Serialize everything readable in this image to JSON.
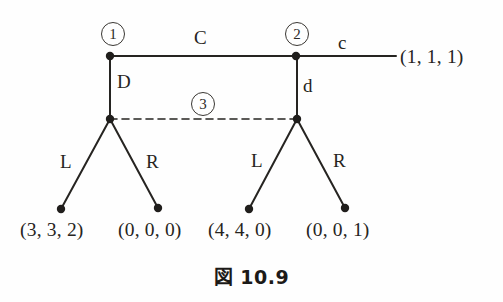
{
  "figure": {
    "caption_mark": "図",
    "caption_number": "10.9",
    "background_color": "#fefefe",
    "ink_color": "#262421"
  },
  "nodes": [
    {
      "id": "node-1",
      "label": "①",
      "plain_label": "1",
      "x": 110,
      "y": 56,
      "kind": "decision"
    },
    {
      "id": "node-2",
      "label": "②",
      "plain_label": "2",
      "x": 296,
      "y": 56,
      "kind": "decision"
    },
    {
      "id": "node-3a",
      "label": "",
      "plain_label": "",
      "x": 110,
      "y": 119,
      "kind": "decision"
    },
    {
      "id": "node-3b",
      "label": "",
      "plain_label": "",
      "x": 297,
      "y": 119,
      "kind": "decision"
    }
  ],
  "information_set": {
    "label": "③",
    "plain_label": "3",
    "style": "dashed",
    "from_x": 110,
    "to_x": 297,
    "y": 119,
    "label_x": 202,
    "label_y": 103
  },
  "edges": [
    {
      "name": "edge-C",
      "action": "C",
      "from": "node-1",
      "to": "node-2",
      "label_x": 201,
      "label_y": 38
    },
    {
      "name": "edge-D",
      "action": "D",
      "from": "node-1",
      "to": "node-3a",
      "label_x": 122,
      "label_y": 82
    },
    {
      "name": "edge-c",
      "action": "c",
      "from": "node-2",
      "to": "terminal-1",
      "label_x": 342,
      "label_y": 42
    },
    {
      "name": "edge-d",
      "action": "d",
      "from": "node-2",
      "to": "node-3b",
      "label_x": 308,
      "label_y": 85
    },
    {
      "name": "edge-L1",
      "action": "L",
      "from": "node-3a",
      "to": "terminal-2",
      "label_x": 66,
      "label_y": 162
    },
    {
      "name": "edge-R1",
      "action": "R",
      "from": "node-3a",
      "to": "terminal-3",
      "label_x": 152,
      "label_y": 162
    },
    {
      "name": "edge-L2",
      "action": "L",
      "from": "node-3b",
      "to": "terminal-4",
      "label_x": 257,
      "label_y": 161
    },
    {
      "name": "edge-R2",
      "action": "R",
      "from": "node-3b",
      "to": "terminal-5",
      "label_x": 339,
      "label_y": 161
    }
  ],
  "terminals": [
    {
      "id": "terminal-1",
      "payoff": "(1, 1, 1)",
      "values": [
        1,
        1,
        1
      ],
      "dot_x": 396,
      "dot_y": 56,
      "text_x": 400,
      "text_y": 48,
      "has_dot": false
    },
    {
      "id": "terminal-2",
      "payoff": "(3, 3, 2)",
      "values": [
        3,
        3,
        2
      ],
      "dot_x": 61,
      "dot_y": 209,
      "text_x": 22,
      "text_y": 222,
      "has_dot": true
    },
    {
      "id": "terminal-3",
      "payoff": "(0, 0, 0)",
      "values": [
        0,
        0,
        0
      ],
      "dot_x": 158,
      "dot_y": 208,
      "text_x": 120,
      "text_y": 222,
      "has_dot": true
    },
    {
      "id": "terminal-4",
      "payoff": "(4, 4, 0)",
      "values": [
        4,
        4,
        0
      ],
      "dot_x": 249,
      "dot_y": 209,
      "text_x": 210,
      "text_y": 222,
      "has_dot": true
    },
    {
      "id": "terminal-5",
      "payoff": "(0, 0, 1)",
      "values": [
        0,
        0,
        1
      ],
      "dot_x": 345,
      "dot_y": 208,
      "text_x": 308,
      "text_y": 222,
      "has_dot": true
    }
  ]
}
